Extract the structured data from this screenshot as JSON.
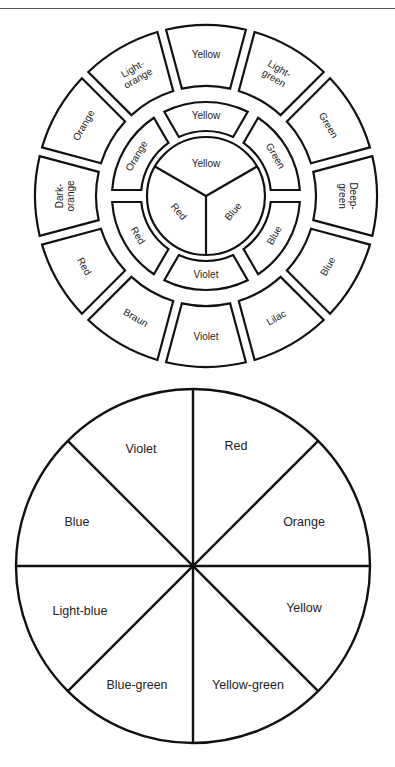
{
  "color_wheel": {
    "center_circle": {
      "segments": [
        {
          "label": "Yellow",
          "angle": 0
        },
        {
          "label": "Blue",
          "angle": 120
        },
        {
          "label": "Red",
          "angle": 240
        }
      ]
    },
    "middle_ring": {
      "segments": [
        {
          "label": "Yellow",
          "angle": 0
        },
        {
          "label": "Green",
          "angle": 60
        },
        {
          "label": "Blue",
          "angle": 120
        },
        {
          "label": "Violet",
          "angle": 180
        },
        {
          "label": "Red",
          "angle": 240
        },
        {
          "label": "Orange",
          "angle": 300
        }
      ]
    },
    "outer_ring": {
      "segments": [
        {
          "label": "Yellow",
          "lines": [
            "Yellow"
          ],
          "angle": 0
        },
        {
          "label": "Light-green",
          "lines": [
            "Light-",
            "green"
          ],
          "angle": 30
        },
        {
          "label": "Green",
          "lines": [
            "Green"
          ],
          "angle": 60
        },
        {
          "label": "Deep-green",
          "lines": [
            "Deep-",
            "green"
          ],
          "angle": 90
        },
        {
          "label": "Blue",
          "lines": [
            "Blue"
          ],
          "angle": 120
        },
        {
          "label": "Lilac",
          "lines": [
            "Lilac"
          ],
          "angle": 150
        },
        {
          "label": "Violet",
          "lines": [
            "Violet"
          ],
          "angle": 180
        },
        {
          "label": "Braun",
          "lines": [
            "Braun"
          ],
          "angle": 210
        },
        {
          "label": "Red",
          "lines": [
            "Red"
          ],
          "angle": 240
        },
        {
          "label": "Dark-orange",
          "lines": [
            "Dark-",
            "orange"
          ],
          "angle": 270
        },
        {
          "label": "Orange",
          "lines": [
            "Orange"
          ],
          "angle": 300
        },
        {
          "label": "Light-orange",
          "lines": [
            "Light-",
            "orange"
          ],
          "angle": 330
        }
      ]
    }
  },
  "pie_wheel": {
    "segments": [
      {
        "label": "Red"
      },
      {
        "label": "Orange"
      },
      {
        "label": "Yellow"
      },
      {
        "label": "Yellow-green"
      },
      {
        "label": "Blue-green"
      },
      {
        "label": "Light-blue"
      },
      {
        "label": "Blue"
      },
      {
        "label": "Violet"
      }
    ]
  }
}
